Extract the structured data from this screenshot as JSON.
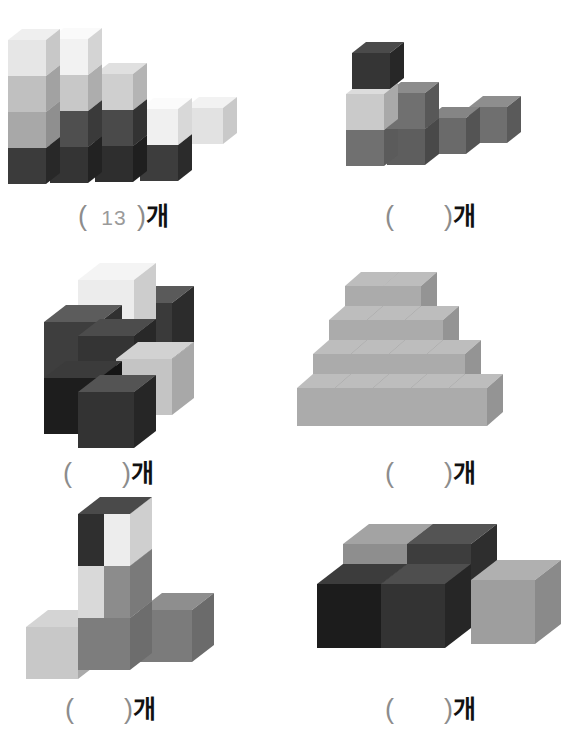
{
  "worksheet": {
    "title": "Counting unit cubes worksheet",
    "background_color": "#ffffff",
    "unit_label": "개",
    "open_paren": "(",
    "close_paren": ")",
    "empty_blank": "",
    "blank_color": "#9a9a9a",
    "paren_color": "#8c8c8c",
    "unit_color": "#111111"
  },
  "problems": [
    {
      "id": "problem-1",
      "position": "top-left",
      "answer": "13",
      "answer_filled": true,
      "cube_count": 13,
      "description": "Descending staircase of stacked cubes, tallest at left",
      "columns": [
        {
          "height": 4
        },
        {
          "height": 4
        },
        {
          "height": 3
        },
        {
          "height": 2
        },
        {
          "height": 1
        }
      ]
    },
    {
      "id": "problem-2",
      "position": "top-right",
      "answer": "",
      "answer_filled": false,
      "cube_count": 7,
      "description": "L-shaped arrangement with one cube stacked on top at left"
    },
    {
      "id": "problem-3",
      "position": "middle-left",
      "answer": "",
      "answer_filled": false,
      "cube_count": 6,
      "description": "Cluster of dark cubes with one light cube on top"
    },
    {
      "id": "problem-4",
      "position": "middle-right",
      "answer": "",
      "answer_filled": false,
      "cube_count": 20,
      "description": "Stepped pyramid of uniform light gray cubes, four rows"
    },
    {
      "id": "problem-5",
      "position": "bottom-left",
      "answer": "",
      "answer_filled": false,
      "cube_count": 5,
      "description": "T-shaped arrangement with two cubes stacked vertically"
    },
    {
      "id": "problem-6",
      "position": "bottom-right",
      "answer": "",
      "answer_filled": false,
      "cube_count": 5,
      "description": "Block of large cubes, two high at the back"
    }
  ],
  "palette": {
    "very_light": "#eeeeee",
    "light": "#d6d6d6",
    "light_mid": "#c2c2c2",
    "mid": "#a6a6a6",
    "mid_dark": "#8a8a8a",
    "dark": "#6e6e6e",
    "darker": "#4d4d4d",
    "very_dark": "#333333",
    "near_black": "#1f1f1f"
  }
}
